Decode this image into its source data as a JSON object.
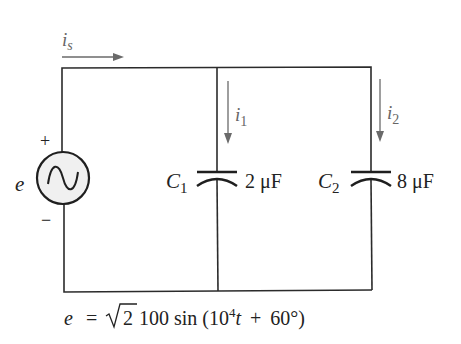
{
  "diagram": {
    "type": "parallel-capacitor-ac-circuit",
    "source": {
      "label": "e",
      "symbol": "ac-sine-source",
      "polarity_plus": "+",
      "polarity_minus": "−"
    },
    "currents": {
      "source": {
        "symbol": "i",
        "subscript": "s"
      },
      "branch1": {
        "symbol": "i",
        "subscript": "1"
      },
      "branch2": {
        "symbol": "i",
        "subscript": "2"
      }
    },
    "capacitors": [
      {
        "name": "C",
        "subscript": "1",
        "value": "2 μF"
      },
      {
        "name": "C",
        "subscript": "2",
        "value": "8 μF"
      }
    ],
    "equation": {
      "lhs": "e",
      "eq": "=",
      "sqrt_arg": "2",
      "amplitude": "100",
      "func": "sin",
      "open": "(",
      "base": "10",
      "exp": "4",
      "var": "t",
      "plus": "+",
      "phase": "60°",
      "close": ")"
    }
  }
}
